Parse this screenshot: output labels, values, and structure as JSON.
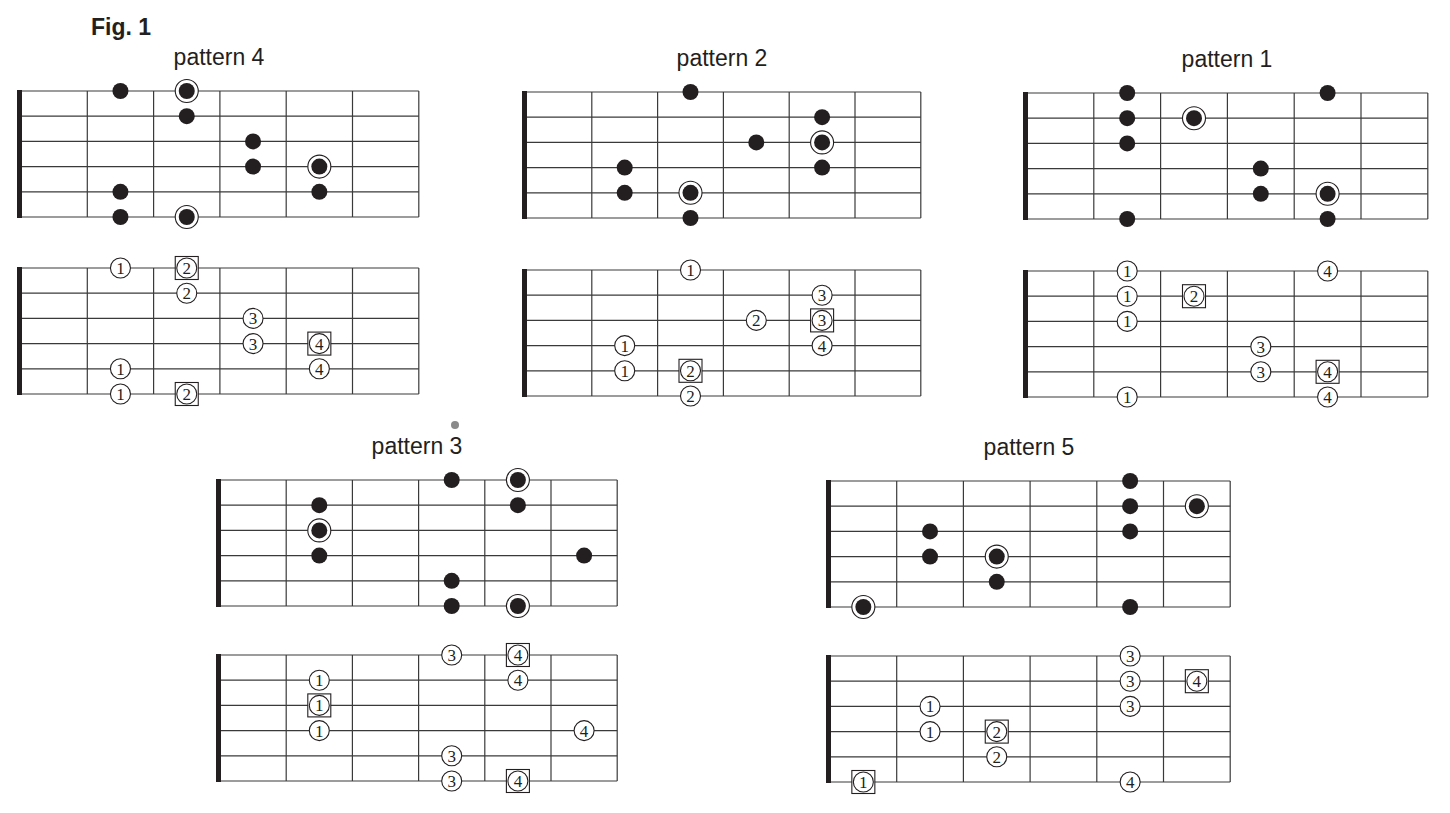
{
  "figure": {
    "title": "Fig. 1"
  },
  "colors": {
    "ink": "#231f20",
    "grid": "#3a3a3a",
    "background": "#ffffff"
  },
  "legend": {
    "filled-dot": "scale note",
    "ringed-dot": "root note",
    "circled-number": "fret-hand finger",
    "boxed-number": "finger on root note"
  },
  "patterns": [
    {
      "id": "pattern-4",
      "label": "pattern 4",
      "label_x": 219,
      "label_y": 44,
      "strings": 6,
      "fret_spaces": 6,
      "fretboard": {
        "nut_x": 21,
        "top_y": 91,
        "fret_w": 66.3,
        "string_h": 25.2
      },
      "fingering": {
        "nut_x": 21,
        "top_y": 268,
        "fret_w": 66.3,
        "string_h": 25.2
      },
      "notes": [
        {
          "s": 0,
          "f": 2,
          "root": false,
          "finger": 1
        },
        {
          "s": 0,
          "f": 3,
          "root": true,
          "finger": 2
        },
        {
          "s": 1,
          "f": 3,
          "root": false,
          "finger": 2
        },
        {
          "s": 2,
          "f": 4,
          "root": false,
          "finger": 3
        },
        {
          "s": 3,
          "f": 4,
          "root": false,
          "finger": 3
        },
        {
          "s": 3,
          "f": 5,
          "root": true,
          "finger": 4
        },
        {
          "s": 4,
          "f": 2,
          "root": false,
          "finger": 1
        },
        {
          "s": 4,
          "f": 5,
          "root": false,
          "finger": 4
        },
        {
          "s": 5,
          "f": 2,
          "root": false,
          "finger": 1
        },
        {
          "s": 5,
          "f": 3,
          "root": true,
          "finger": 2
        }
      ]
    },
    {
      "id": "pattern-2",
      "label": "pattern 2",
      "label_x": 722,
      "label_y": 45,
      "strings": 6,
      "fret_spaces": 6,
      "fretboard": {
        "nut_x": 526,
        "top_y": 92,
        "fret_w": 65.8,
        "string_h": 25.2
      },
      "fingering": {
        "nut_x": 526,
        "top_y": 270,
        "fret_w": 65.8,
        "string_h": 25.2
      },
      "notes": [
        {
          "s": 0,
          "f": 3,
          "root": false,
          "finger": 1
        },
        {
          "s": 1,
          "f": 5,
          "root": false,
          "finger": 3
        },
        {
          "s": 2,
          "f": 4,
          "root": false,
          "finger": 2
        },
        {
          "s": 2,
          "f": 5,
          "root": true,
          "finger": 3
        },
        {
          "s": 3,
          "f": 2,
          "root": false,
          "finger": 1
        },
        {
          "s": 3,
          "f": 5,
          "root": false,
          "finger": 4
        },
        {
          "s": 4,
          "f": 2,
          "root": false,
          "finger": 1
        },
        {
          "s": 4,
          "f": 3,
          "root": true,
          "finger": 2
        },
        {
          "s": 5,
          "f": 3,
          "root": false,
          "finger": 2
        }
      ]
    },
    {
      "id": "pattern-1",
      "label": "pattern 1",
      "label_x": 1227,
      "label_y": 46,
      "strings": 6,
      "fret_spaces": 6,
      "fretboard": {
        "nut_x": 1027,
        "top_y": 93,
        "fret_w": 66.8,
        "string_h": 25.2
      },
      "fingering": {
        "nut_x": 1027,
        "top_y": 271,
        "fret_w": 66.8,
        "string_h": 25.2
      },
      "notes": [
        {
          "s": 0,
          "f": 2,
          "root": false,
          "finger": 1
        },
        {
          "s": 0,
          "f": 5,
          "root": false,
          "finger": 4
        },
        {
          "s": 1,
          "f": 2,
          "root": false,
          "finger": 1
        },
        {
          "s": 1,
          "f": 3,
          "root": true,
          "finger": 2
        },
        {
          "s": 2,
          "f": 2,
          "root": false,
          "finger": 1
        },
        {
          "s": 3,
          "f": 4,
          "root": false,
          "finger": 3
        },
        {
          "s": 4,
          "f": 4,
          "root": false,
          "finger": 3
        },
        {
          "s": 4,
          "f": 5,
          "root": true,
          "finger": 4
        },
        {
          "s": 5,
          "f": 2,
          "root": false,
          "finger": 1
        },
        {
          "s": 5,
          "f": 5,
          "root": false,
          "finger": 4
        }
      ]
    },
    {
      "id": "pattern-3",
      "label": "pattern 3",
      "label_x": 417,
      "label_y": 433,
      "strings": 6,
      "fret_spaces": 6,
      "fretboard": {
        "nut_x": 220,
        "top_y": 480,
        "fret_w": 66.2,
        "string_h": 25.2
      },
      "fingering": {
        "nut_x": 220,
        "top_y": 655,
        "fret_w": 66.2,
        "string_h": 25.2
      },
      "notes": [
        {
          "s": 0,
          "f": 4,
          "root": false,
          "finger": 3
        },
        {
          "s": 0,
          "f": 5,
          "root": true,
          "finger": 4
        },
        {
          "s": 1,
          "f": 2,
          "root": false,
          "finger": 1
        },
        {
          "s": 1,
          "f": 5,
          "root": false,
          "finger": 4
        },
        {
          "s": 2,
          "f": 2,
          "root": true,
          "finger": 1
        },
        {
          "s": 3,
          "f": 2,
          "root": false,
          "finger": 1
        },
        {
          "s": 3,
          "f": 6,
          "root": false,
          "finger": 4
        },
        {
          "s": 4,
          "f": 4,
          "root": false,
          "finger": 3
        },
        {
          "s": 5,
          "f": 4,
          "root": false,
          "finger": 3
        },
        {
          "s": 5,
          "f": 5,
          "root": true,
          "finger": 4
        }
      ]
    },
    {
      "id": "pattern-5",
      "label": "pattern 5",
      "label_x": 1029,
      "label_y": 434,
      "strings": 6,
      "fret_spaces": 6,
      "fretboard": {
        "nut_x": 830,
        "top_y": 481,
        "fret_w": 66.7,
        "string_h": 25.2
      },
      "fingering": {
        "nut_x": 830,
        "top_y": 656,
        "fret_w": 66.7,
        "string_h": 25.2
      },
      "notes": [
        {
          "s": 0,
          "f": 5,
          "root": false,
          "finger": 3
        },
        {
          "s": 1,
          "f": 5,
          "root": false,
          "finger": 3
        },
        {
          "s": 1,
          "f": 6,
          "root": true,
          "finger": 4
        },
        {
          "s": 2,
          "f": 2,
          "root": false,
          "finger": 1
        },
        {
          "s": 2,
          "f": 5,
          "root": false,
          "finger": 3
        },
        {
          "s": 3,
          "f": 2,
          "root": false,
          "finger": 1
        },
        {
          "s": 3,
          "f": 3,
          "root": true,
          "finger": 2
        },
        {
          "s": 4,
          "f": 3,
          "root": false,
          "finger": 2
        },
        {
          "s": 5,
          "f": 1,
          "root": true,
          "finger": 1
        },
        {
          "s": 5,
          "f": 5,
          "root": false,
          "finger": 4
        }
      ]
    }
  ]
}
